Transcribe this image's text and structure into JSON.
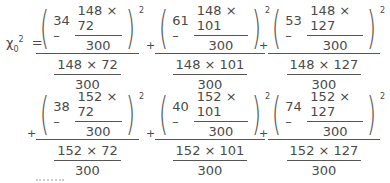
{
  "lhs": {
    "symbol": "χ",
    "subscript": "0",
    "superscript": "2",
    "equals": "="
  },
  "operator": "+",
  "terms": [
    {
      "observed": "34 –",
      "expected_num": "148 × 72",
      "expected_den": "300",
      "power": "2",
      "denom_num": "148 × 72",
      "denom_den": "300"
    },
    {
      "observed": "61 –",
      "expected_num": "148 × 101",
      "expected_den": "300",
      "power": "2",
      "denom_num": "148 × 101",
      "denom_den": "300"
    },
    {
      "observed": "53 –",
      "expected_num": "148 × 127",
      "expected_den": "300",
      "power": "2",
      "denom_num": "148 × 127",
      "denom_den": "300"
    },
    {
      "observed": "38 –",
      "expected_num": "152 × 72",
      "expected_den": "300",
      "power": "2",
      "denom_num": "152 × 72",
      "denom_den": "300"
    },
    {
      "observed": "40 –",
      "expected_num": "152 × 101",
      "expected_den": "300",
      "power": "2",
      "denom_num": "152 × 101",
      "denom_den": "300"
    },
    {
      "observed": "74 –",
      "expected_num": "152 × 127",
      "expected_den": "300",
      "power": "2",
      "denom_num": "152 × 127",
      "denom_den": "300"
    }
  ]
}
